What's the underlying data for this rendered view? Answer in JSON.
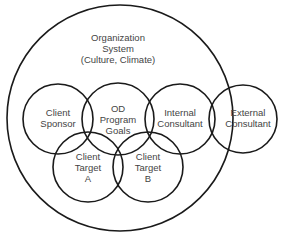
{
  "diagram": {
    "organization": {
      "lines": [
        "Organization",
        "System",
        "(Culture, Climate)"
      ]
    },
    "circles": [
      {
        "id": "client-sponsor",
        "lines": [
          "Client",
          "Sponsor"
        ]
      },
      {
        "id": "od-program-goals",
        "lines": [
          "OD",
          "Program",
          "Goals"
        ]
      },
      {
        "id": "internal-consultant",
        "lines": [
          "Internal",
          "Consultant"
        ]
      },
      {
        "id": "external-consultant",
        "lines": [
          "External",
          "Consultant"
        ]
      },
      {
        "id": "client-target-a",
        "lines": [
          "Client",
          "Target",
          "A"
        ]
      },
      {
        "id": "client-target-b",
        "lines": [
          "Client",
          "Target",
          "B"
        ]
      }
    ]
  }
}
